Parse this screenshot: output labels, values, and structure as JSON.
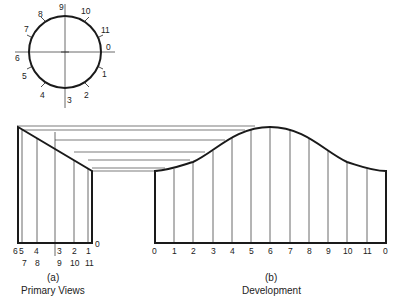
{
  "figure": {
    "circle_view": {
      "division_labels": [
        "0",
        "1",
        "2",
        "3",
        "4",
        "5",
        "6",
        "7",
        "8",
        "9",
        "10",
        "11"
      ],
      "center": [
        65,
        52
      ],
      "radius": 36
    },
    "primary_view": {
      "label_letter": "(a)",
      "caption": "Primary Views",
      "top_row_labels": [
        "6",
        "5",
        "4",
        "3",
        "2",
        "1"
      ],
      "bottom_row_labels": [
        "7",
        "8",
        "9",
        "10",
        "11"
      ],
      "end_label": "0"
    },
    "development": {
      "label_letter": "(b)",
      "caption": "Development",
      "station_labels": [
        "0",
        "1",
        "2",
        "3",
        "4",
        "5",
        "6",
        "7",
        "8",
        "9",
        "10",
        "11",
        "0"
      ]
    },
    "colors": {
      "line": "#1a1a1a",
      "thin_line": "#444444",
      "background": "#ffffff"
    }
  }
}
